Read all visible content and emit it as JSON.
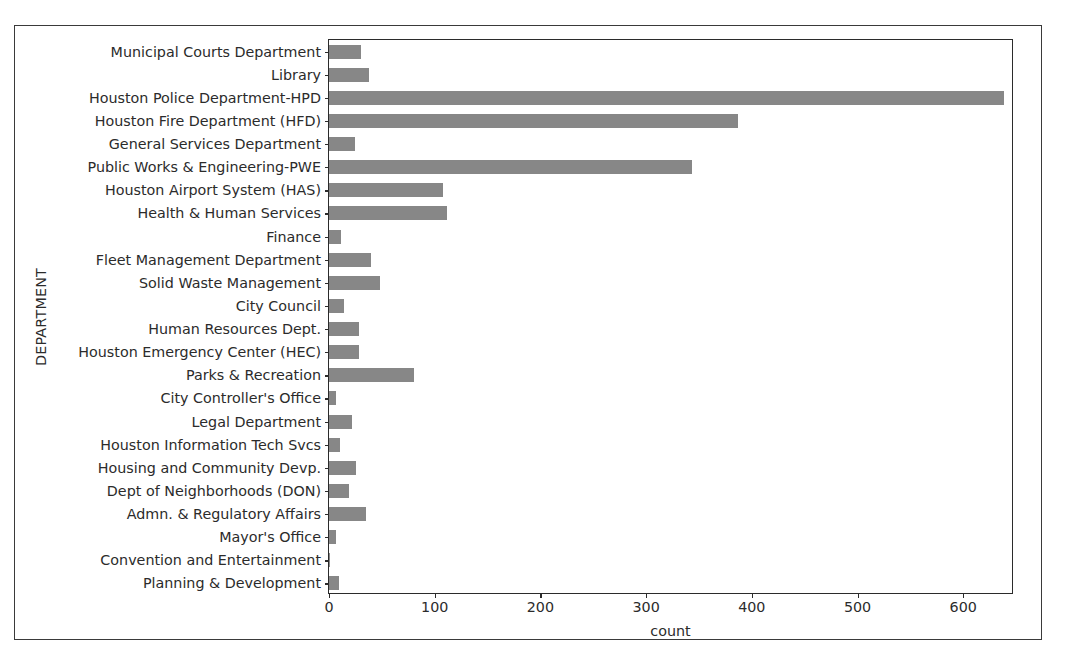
{
  "chart_data": {
    "type": "bar",
    "orientation": "horizontal",
    "title": "",
    "xlabel": "count",
    "ylabel": "DEPARTMENT",
    "xlim": [
      0,
      648
    ],
    "xticks": [
      0,
      100,
      200,
      300,
      400,
      500,
      600
    ],
    "xticklabels": [
      "0",
      "100",
      "200",
      "300",
      "400",
      "500",
      "600"
    ],
    "grid": false,
    "legend": null,
    "bar_color": "#878787",
    "categories": [
      "Municipal Courts Department",
      "Library",
      "Houston Police Department-HPD",
      "Houston Fire Department (HFD)",
      "General Services Department",
      "Public Works & Engineering-PWE",
      "Houston Airport System (HAS)",
      "Health & Human Services",
      "Finance",
      "Fleet Management Department",
      "Solid Waste Management",
      "City Council",
      "Human Resources Dept.",
      "Houston Emergency Center (HEC)",
      "Parks & Recreation",
      "City Controller's Office",
      "Legal Department",
      "Houston Information Tech Svcs",
      "Housing and Community Devp.",
      "Dept of Neighborhoods (DON)",
      "Admn. & Regulatory Affairs",
      "Mayor's Office",
      "Convention and Entertainment",
      "Planning & Development"
    ],
    "values": [
      30,
      38,
      639,
      387,
      25,
      343,
      108,
      112,
      11,
      40,
      48,
      14,
      28,
      28,
      80,
      7,
      22,
      10,
      26,
      19,
      35,
      7,
      1,
      9
    ]
  }
}
